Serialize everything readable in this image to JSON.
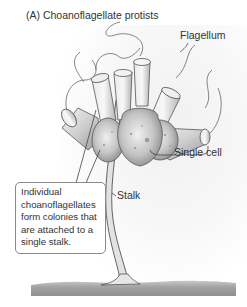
{
  "figure": {
    "title": "(A)  Choanoflagellate protists",
    "labels": {
      "flagellum": "Flagellum",
      "single_cell": "Single cell",
      "stalk": "Stalk"
    },
    "callout": {
      "text": "Individual choanoflagellates form colonies that are attached to a single stalk."
    },
    "colors": {
      "line": "#555555",
      "cell_fill": "#d8d8d8",
      "cell_shade": "#9a9a9a",
      "substrate": "#9c9c9c",
      "callout_border": "#8a8a8a"
    }
  }
}
